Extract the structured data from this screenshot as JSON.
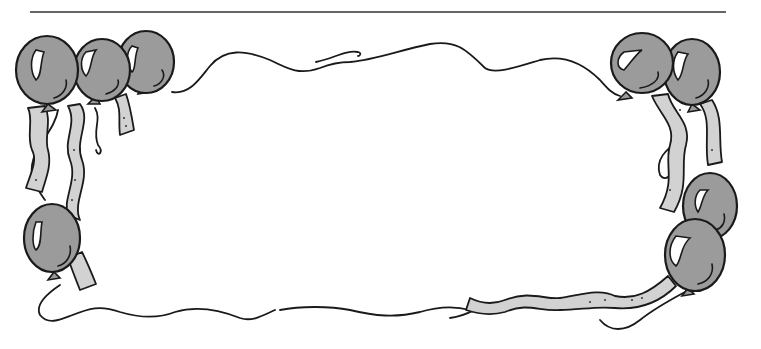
{
  "illustration": {
    "subject": "balloon border frame",
    "description": "Black-and-gray clip-art frame of party balloons with ribbons and wavy strings surrounding an empty blank area",
    "colors": {
      "balloon_fill": "#9b9b9b",
      "ribbon_fill": "#d2d2d2",
      "outline": "#1a1a1a",
      "highlight": "#ffffff",
      "background": "#ffffff",
      "top_rule": "#333333"
    },
    "elements": {
      "top_rule": "horizontal line",
      "balloon_count": 8,
      "top_left_balloons": 3,
      "top_right_balloons": 2,
      "left_lower_balloons": 1,
      "right_lower_balloons": 2
    }
  }
}
